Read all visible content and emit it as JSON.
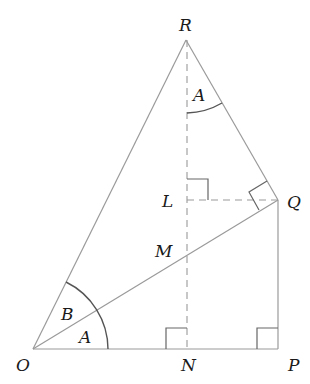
{
  "diagram": {
    "points": {
      "O": {
        "label": "O",
        "x": 33,
        "y": 349
      },
      "N": {
        "label": "N",
        "x": 187,
        "y": 349
      },
      "P": {
        "label": "P",
        "x": 278,
        "y": 349
      },
      "Q": {
        "label": "Q",
        "x": 278,
        "y": 200
      },
      "R": {
        "label": "R",
        "x": 186,
        "y": 40
      },
      "L": {
        "label": "L",
        "x": 187,
        "y": 200
      },
      "M": {
        "label": "M",
        "x": 187,
        "y": 266
      }
    },
    "angles": {
      "angle_A_at_O": "A",
      "angle_B_at_O": "B",
      "angle_A_at_R": "A"
    },
    "segments": {
      "solid": [
        "OR",
        "RQ",
        "OQ",
        "OP",
        "QP"
      ],
      "dashed": [
        "RN",
        "LQ"
      ]
    },
    "right_angles": [
      "N",
      "P",
      "L",
      "Q"
    ],
    "colors": {
      "line": "#9a9a9a",
      "arc": "#555555",
      "text": "#1a1a1a"
    }
  }
}
